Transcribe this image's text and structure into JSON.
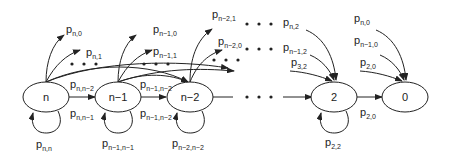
{
  "diagram": {
    "type": "markov-chain",
    "nodes": [
      {
        "id": "n",
        "label": "n"
      },
      {
        "id": "n-1",
        "label": "n−1"
      },
      {
        "id": "n-2",
        "label": "n−2"
      },
      {
        "id": "2",
        "label": "2"
      },
      {
        "id": "0",
        "label": "0"
      }
    ],
    "labels": {
      "p_n_0": {
        "p": "p",
        "sub": "n,0"
      },
      "p_n_1": {
        "p": "p",
        "sub": "n,1"
      },
      "p_n_n2": {
        "p": "p",
        "sub": "n,n−2"
      },
      "p_n_n1": {
        "p": "p",
        "sub": "n,n−1"
      },
      "p_n_n": {
        "p": "p",
        "sub": "n,n"
      },
      "p_n1_0": {
        "p": "p",
        "sub": "n−1,0"
      },
      "p_n1_1": {
        "p": "p",
        "sub": "n−1,1"
      },
      "p_n1_n2_top": {
        "p": "p",
        "sub": "n−1,n−2"
      },
      "p_n1_n2": {
        "p": "p",
        "sub": "n−1,n−2"
      },
      "p_n1_n1": {
        "p": "p",
        "sub": "n−1,n−1"
      },
      "p_n2_1": {
        "p": "p",
        "sub": "n−2,1"
      },
      "p_n2_0": {
        "p": "p",
        "sub": "n−2,0"
      },
      "p_n2_n2": {
        "p": "p",
        "sub": "n−2,n−2"
      },
      "p_n_2": {
        "p": "p",
        "sub": "n,2"
      },
      "p_nm1_2": {
        "p": "p",
        "sub": "n−1,2"
      },
      "p_3_2": {
        "p": "p",
        "sub": "3,2"
      },
      "p_2_2": {
        "p": "p",
        "sub": "2,2"
      },
      "p_n_0_right": {
        "p": "p",
        "sub": "n,0"
      },
      "p_nm1_0_right": {
        "p": "p",
        "sub": "n−1,0"
      },
      "p_2_0_top": {
        "p": "p",
        "sub": "2,0"
      },
      "p_2_0": {
        "p": "p",
        "sub": "2,0"
      }
    }
  }
}
